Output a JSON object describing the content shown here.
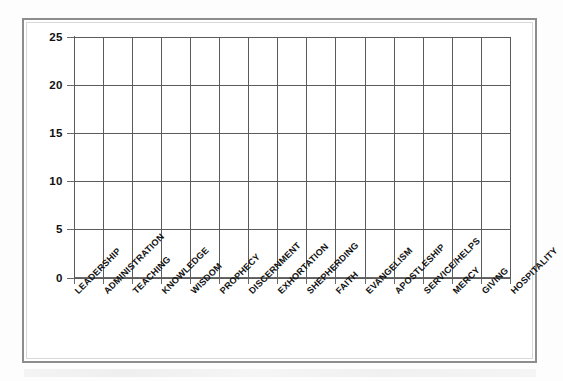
{
  "document": {
    "kind": "worksheet-chart",
    "frame_color": "#8d8d8d",
    "grid_color": "#5b5b5b",
    "background": "#ffffff"
  },
  "chart_data": {
    "type": "bar",
    "title": "",
    "subtitle": "",
    "xlabel": "",
    "ylabel": "",
    "ylim": [
      0,
      25
    ],
    "ytick_step": 5,
    "grid": true,
    "legend": false,
    "note": "blank score-tally grid; no bars plotted",
    "yticks": [
      "25",
      "20",
      "15",
      "10",
      "5",
      "0"
    ],
    "ytick_values": [
      25,
      20,
      15,
      10,
      5,
      0
    ],
    "categories": [
      "LEADERSHIP",
      "ADMINISTRATION",
      "TEACHING",
      "KNOWLEDGE",
      "WISDOM",
      "PROPHECY",
      "DISCERNMENT",
      "EXHORTATION",
      "SHEPHERDING",
      "FAITH",
      "EVANGELISM",
      "APOSTLESHIP",
      "SERVICE/HELPS",
      "MERCY",
      "GIVING",
      "HOSPITALITY"
    ],
    "values": [
      0,
      0,
      0,
      0,
      0,
      0,
      0,
      0,
      0,
      0,
      0,
      0,
      0,
      0,
      0,
      0
    ]
  }
}
